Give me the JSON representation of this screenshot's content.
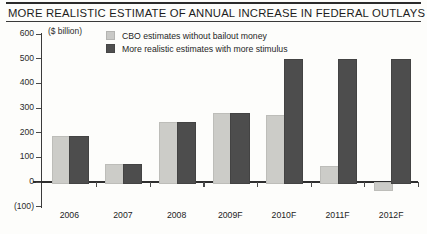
{
  "header": {
    "title": "MORE REALISTIC ESTIMATE OF ANNUAL INCREASE IN FEDERAL OUTLAYS"
  },
  "chart_data": {
    "type": "bar",
    "title": "MORE REALISTIC ESTIMATE OF ANNUAL INCREASE IN FEDERAL OUTLAYS",
    "unit_label": "($ billion)",
    "xlabel": "",
    "ylabel": "",
    "ylim": [
      -100,
      600
    ],
    "yticks": [
      -100,
      0,
      100,
      200,
      300,
      400,
      500,
      600
    ],
    "ytick_labels": [
      "(100)",
      "0",
      "100",
      "200",
      "300",
      "400",
      "500",
      "600"
    ],
    "grid": false,
    "legend_position": "top",
    "categories": [
      "2006",
      "2007",
      "2008",
      "2009F",
      "2010F",
      "2011F",
      "2012F"
    ],
    "series": [
      {
        "name": "CBO estimates without bailout money",
        "color": "#ccccc8",
        "values": [
          185,
          75,
          245,
          280,
          270,
          65,
          -30
        ]
      },
      {
        "name": "More realistic estimates with more stimulus",
        "color": "#4d4d4d",
        "values": [
          185,
          75,
          245,
          280,
          500,
          500,
          500
        ]
      }
    ]
  }
}
